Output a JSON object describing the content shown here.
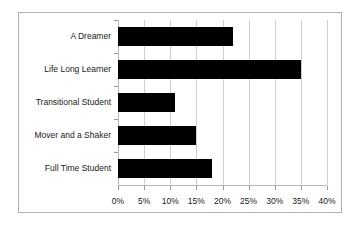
{
  "chart_data": {
    "type": "bar",
    "orientation": "horizontal",
    "title": "",
    "xlabel": "",
    "ylabel": "",
    "categories": [
      "A Dreamer",
      "Life Long Learner",
      "Transitional Student",
      "Mover and a Shaker",
      "Full Time Student"
    ],
    "values": [
      22,
      35,
      11,
      15,
      18
    ],
    "value_unit": "%",
    "xlim": [
      0,
      40
    ],
    "xticks": [
      0,
      5,
      10,
      15,
      20,
      25,
      30,
      35,
      40
    ],
    "xtick_labels": [
      "0%",
      "5%",
      "10%",
      "15%",
      "20%",
      "25%",
      "30%",
      "35%",
      "40%"
    ],
    "grid": "vertical",
    "legend": "none",
    "bar_color": "#000000",
    "gridline_color": "#cfcfcf",
    "axis_color": "#b9b9b9",
    "border_color": "#b0b0b0",
    "background_color": "#ffffff"
  }
}
